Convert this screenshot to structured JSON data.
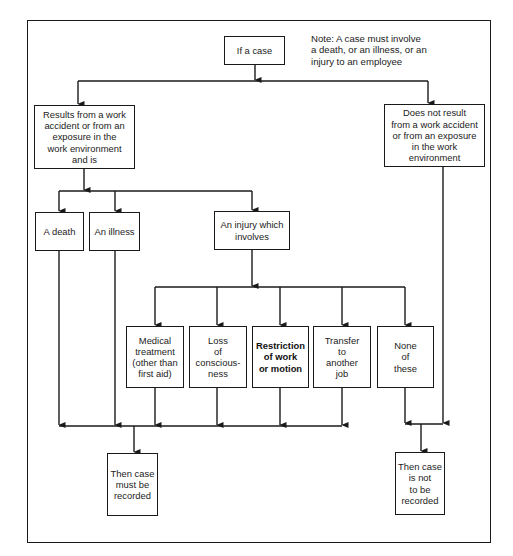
{
  "diagram": {
    "note": "Note: A case must involve\na death, or an illness, or an\ninjury to an employee",
    "nodes": {
      "start": "If a case",
      "work_related": "Results from a work\naccident or from an\nexposure in the\nwork environment\nand is",
      "not_work_related": "Does not result\nfrom a work accident\nor from an exposure\nin the work\nenvironment",
      "death": "A death",
      "illness": "An illness",
      "injury": "An injury which\ninvolves",
      "medical_treatment": "Medical\ntreatment\n(other than\nfirst aid)",
      "loss_of_consciousness": "Loss\nof\nconscious-\nness",
      "restriction": "Restriction\nof work\nor motion",
      "transfer": "Transfer\nto\nanother\njob",
      "none": "None\nof\nthese",
      "must_record": "Then case\nmust be\nrecorded",
      "not_record": "Then case\nis not\nto be\nrecorded"
    },
    "edges": [
      {
        "from": "start",
        "to": "work_related"
      },
      {
        "from": "start",
        "to": "not_work_related"
      },
      {
        "from": "work_related",
        "to": "death"
      },
      {
        "from": "work_related",
        "to": "illness"
      },
      {
        "from": "work_related",
        "to": "injury"
      },
      {
        "from": "injury",
        "to": "medical_treatment"
      },
      {
        "from": "injury",
        "to": "loss_of_consciousness"
      },
      {
        "from": "injury",
        "to": "restriction"
      },
      {
        "from": "injury",
        "to": "transfer"
      },
      {
        "from": "injury",
        "to": "none"
      },
      {
        "from": "death",
        "to": "must_record"
      },
      {
        "from": "illness",
        "to": "must_record"
      },
      {
        "from": "medical_treatment",
        "to": "must_record"
      },
      {
        "from": "loss_of_consciousness",
        "to": "must_record"
      },
      {
        "from": "restriction",
        "to": "must_record"
      },
      {
        "from": "transfer",
        "to": "must_record"
      },
      {
        "from": "none",
        "to": "not_record"
      },
      {
        "from": "not_work_related",
        "to": "not_record"
      }
    ],
    "colors": {
      "line": "#1a1a1a",
      "background": "#ffffff",
      "text": "#222222"
    }
  }
}
